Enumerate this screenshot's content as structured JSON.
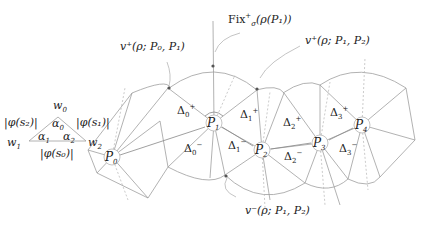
{
  "triangle": {
    "vertices": {
      "top": "w",
      "top_sub": "0",
      "left": "w",
      "left_sub": "1",
      "right": "w",
      "right_sub": "2"
    },
    "angles": [
      {
        "sym": "α",
        "sub": "0"
      },
      {
        "sym": "α",
        "sub": "1"
      },
      {
        "sym": "α",
        "sub": "2"
      }
    ],
    "edges": {
      "left": "|φ(s₂)|",
      "right": "|φ(s₁)|",
      "bottom": "|φ(s₀)|"
    }
  },
  "points": [
    {
      "name": "P",
      "sub": "0"
    },
    {
      "name": "P",
      "sub": "1"
    },
    {
      "name": "P",
      "sub": "2"
    },
    {
      "name": "P",
      "sub": "3"
    },
    {
      "name": "P",
      "sub": "4"
    }
  ],
  "triangles": [
    {
      "sym": "Δ",
      "sub": "0",
      "sup": "+"
    },
    {
      "sym": "Δ",
      "sub": "0",
      "sup": "−"
    },
    {
      "sym": "Δ",
      "sub": "1",
      "sup": "+"
    },
    {
      "sym": "Δ",
      "sub": "1",
      "sup": "−"
    },
    {
      "sym": "Δ",
      "sub": "2",
      "sup": "+"
    },
    {
      "sym": "Δ",
      "sub": "2",
      "sup": "−"
    },
    {
      "sym": "Δ",
      "sub": "3",
      "sup": "+"
    },
    {
      "sym": "Δ",
      "sub": "3",
      "sup": "−"
    }
  ],
  "annotations": {
    "fix": "Fix",
    "fix_sup": "+",
    "fix_sub": "σ",
    "fix_arg": "(ρ(P₁))",
    "v_plus_01": "v⁺(ρ; P₀, P₁)",
    "v_plus_12": "v⁺(ρ; P₁, P₂)",
    "v_minus_12": "v⁻(ρ; P₁, P₂)"
  },
  "colors": {
    "line": "#9a9a9a",
    "dashed": "#b0b0b0",
    "text": "#222222",
    "dot": "#555555"
  }
}
